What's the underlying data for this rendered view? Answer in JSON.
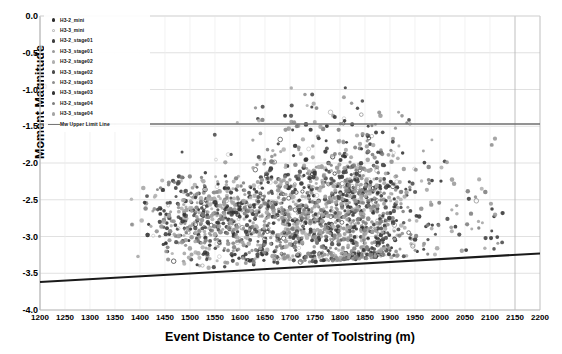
{
  "chart_data": {
    "type": "scatter",
    "title": "",
    "xlabel": "Event Distance to Center of Toolstring (m)",
    "ylabel": "Moment Magnitude",
    "xlim": [
      1200,
      2200
    ],
    "ylim": [
      -4.0,
      0.0
    ],
    "xticks": [
      1200,
      1250,
      1300,
      1350,
      1400,
      1450,
      1500,
      1550,
      1600,
      1650,
      1700,
      1750,
      1800,
      1850,
      1900,
      1950,
      2000,
      2050,
      2100,
      2150,
      2200
    ],
    "yticks": [
      "0.0",
      "-0.5",
      "-1.0",
      "-1.5",
      "-2.0",
      "-2.5",
      "-3.0",
      "-3.5",
      "-4.0"
    ],
    "ytick_values": [
      0.0,
      -0.5,
      -1.0,
      -1.5,
      -2.0,
      -2.5,
      -3.0,
      -3.5,
      -4.0
    ],
    "grid": true,
    "legend_position": "top-left",
    "annotations": [
      {
        "name": "mw-upper-limit-line",
        "type": "horizontal-line",
        "y": -1.47,
        "x_start": 1200,
        "x_end": 2200,
        "color": "#6f6f6f"
      },
      {
        "name": "mw-lower-limit-line",
        "type": "sloped-line",
        "x_start": 1200,
        "y_start": -3.62,
        "x_end": 2200,
        "y_end": -3.23,
        "color": "#1a1a1a"
      }
    ],
    "series": [
      {
        "name": "H3-2_mini",
        "marker": "filled-circle",
        "color": "#2b2b2b",
        "count": 60
      },
      {
        "name": "H3-3_mini",
        "marker": "open-circle",
        "color": "#c9c9c9",
        "count": 55
      },
      {
        "name": "H3-2_stage01",
        "marker": "filled-circle",
        "color": "#3d3d3d",
        "count": 210
      },
      {
        "name": "H3-3_stage01",
        "marker": "filled-circle",
        "color": "#9a9a9a",
        "count": 230
      },
      {
        "name": "H3-2_stage02",
        "marker": "filled-circle",
        "color": "#b0b0b0",
        "count": 240
      },
      {
        "name": "H3-3_stage02",
        "marker": "filled-circle",
        "color": "#4a4a4a",
        "count": 250
      },
      {
        "name": "H3-2_stage03",
        "marker": "filled-circle",
        "color": "#8e8e8e",
        "count": 260
      },
      {
        "name": "H3-3_stage03",
        "marker": "filled-circle",
        "color": "#333333",
        "count": 265
      },
      {
        "name": "H3-2_stage04",
        "marker": "filled-circle",
        "color": "#7d7d7d",
        "count": 255
      },
      {
        "name": "H3-3_stage04",
        "marker": "filled-circle",
        "color": "#a5a5a5",
        "count": 245
      }
    ],
    "cluster_description": {
      "x_center": 1850,
      "y_center": -2.7,
      "x_spread": 140,
      "y_spread": 0.45,
      "total_points": 2070
    }
  },
  "legend": {
    "items": [
      {
        "label": "H3-2_mini",
        "marker": "filled-circle",
        "color": "#2b2b2b"
      },
      {
        "label": "H3-3_mini",
        "marker": "open-circle",
        "color": "#bdbdbd"
      },
      {
        "label": "H3-2_stage01",
        "marker": "filled-circle",
        "color": "#3d3d3d"
      },
      {
        "label": "H3-3_stage01",
        "marker": "filled-circle",
        "color": "#9a9a9a"
      },
      {
        "label": "H3-2_stage02",
        "marker": "filled-circle",
        "color": "#b0b0b0"
      },
      {
        "label": "H3-3_stage02",
        "marker": "filled-circle",
        "color": "#4a4a4a"
      },
      {
        "label": "H3-2_stage03",
        "marker": "filled-circle",
        "color": "#8e8e8e"
      },
      {
        "label": "H3-3_stage03",
        "marker": "filled-circle",
        "color": "#333333"
      },
      {
        "label": "H3-2_stage04",
        "marker": "filled-circle",
        "color": "#7d7d7d"
      },
      {
        "label": "H3-3_stage04",
        "marker": "filled-circle",
        "color": "#a5a5a5"
      },
      {
        "label": "Mw Upper Limit Line",
        "marker": "line",
        "color": "#777777"
      }
    ]
  },
  "colors": {
    "grid": "#d9d9d9",
    "axis": "#bfbfbf",
    "upper_limit_line": "#6f6f6f",
    "lower_limit_line": "#1a1a1a",
    "background": "#ffffff",
    "text": "#000000"
  }
}
